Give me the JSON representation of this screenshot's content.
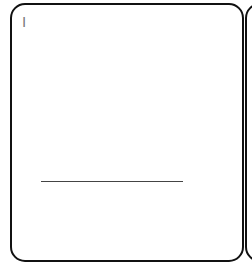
{
  "cards": [
    {
      "label": "I",
      "has_rule": true
    },
    {
      "label": "",
      "has_rule": false
    }
  ],
  "colors": {
    "border": "#111111",
    "label": "#7a7a7a",
    "rule": "#444444",
    "background": "#ffffff"
  }
}
